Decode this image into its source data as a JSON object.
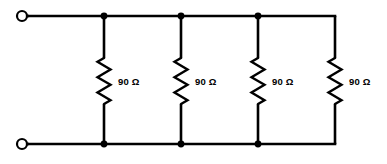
{
  "figure": {
    "background_color": "#ffffff",
    "line_color": "#000000",
    "width": 387,
    "height": 164
  },
  "terminals": [
    {
      "id": "terminal-top-left",
      "label": "",
      "cx": 22,
      "cy": 16,
      "r": 5
    },
    {
      "id": "terminal-bottom-left",
      "label": "",
      "cx": 22,
      "cy": 144,
      "r": 5
    }
  ],
  "rails": {
    "top": {
      "y": 16,
      "x_start": 27,
      "x_end": 335
    },
    "bottom": {
      "y": 144,
      "x_start": 27,
      "x_end": 335
    }
  },
  "branches": [
    {
      "id": "branch-1",
      "x": 104,
      "label": "90 Ω",
      "value": 90,
      "unit": "Ω",
      "label_x": 118,
      "label_y": 82,
      "has_node_dots": true
    },
    {
      "id": "branch-2",
      "x": 181,
      "label": "90 Ω",
      "value": 90,
      "unit": "Ω",
      "label_x": 195,
      "label_y": 82,
      "has_node_dots": true
    },
    {
      "id": "branch-3",
      "x": 258,
      "label": "90 Ω",
      "value": 90,
      "unit": "Ω",
      "label_x": 272,
      "label_y": 82,
      "has_node_dots": true
    },
    {
      "id": "branch-4",
      "x": 335,
      "label": "90 Ω",
      "value": 90,
      "unit": "Ω",
      "label_x": 349,
      "label_y": 82,
      "has_node_dots": false
    }
  ],
  "resistor_geometry": {
    "top_y": 58,
    "bottom_y": 104,
    "amplitude": 6.5,
    "zigs": 6
  }
}
